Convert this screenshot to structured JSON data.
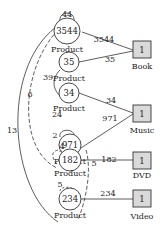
{
  "diagram": {
    "product_nodes": [
      {
        "id": "p1",
        "value": "3544",
        "caption": "Product",
        "self_loop": "44",
        "self_loop_style": "solid"
      },
      {
        "id": "p2",
        "value": "35",
        "caption": "Product"
      },
      {
        "id": "p3",
        "value": "34",
        "caption": "Product"
      },
      {
        "id": "p4",
        "value": "971",
        "caption": "Product",
        "self_loop": "24",
        "self_loop_style": "solid"
      },
      {
        "id": "p5",
        "value": "182",
        "caption": "Product",
        "self_loop": "4",
        "self_loop_style": "dashed"
      },
      {
        "id": "p6",
        "value": "234",
        "caption": "Product",
        "self_loop": "5",
        "self_loop_style": "dashed"
      }
    ],
    "category_nodes": [
      {
        "id": "c1",
        "value": "1",
        "caption": "Book"
      },
      {
        "id": "c2",
        "value": "1",
        "caption": "Music"
      },
      {
        "id": "c3",
        "value": "1",
        "caption": "DVD"
      },
      {
        "id": "c4",
        "value": "1",
        "caption": "Video"
      }
    ],
    "category_edges": [
      {
        "from": "p1",
        "to": "c1",
        "label": "3544"
      },
      {
        "from": "p2",
        "to": "c1",
        "label": "35"
      },
      {
        "from": "p3",
        "to": "c2",
        "label": "34"
      },
      {
        "from": "p4",
        "to": "c2",
        "label": "971"
      },
      {
        "from": "p5",
        "to": "c3",
        "label": "182"
      },
      {
        "from": "p6",
        "to": "c4",
        "label": "234"
      }
    ],
    "product_edges": [
      {
        "from": "p1",
        "to": "p6",
        "label": "13",
        "style": "solid"
      },
      {
        "from": "p1",
        "to": "p5",
        "label": "6",
        "style": "dashed"
      },
      {
        "from": "p2",
        "to": "p3",
        "label": "39",
        "style": "solid"
      },
      {
        "from": "p4",
        "to": "p5",
        "label": "2",
        "style": "dashed"
      },
      {
        "from": "p4",
        "to": "p6",
        "label": "5",
        "style": "dashed"
      }
    ],
    "colors": {
      "stroke": "#333333",
      "box_fill": "#d9d9d9",
      "background": "#ffffff"
    }
  }
}
